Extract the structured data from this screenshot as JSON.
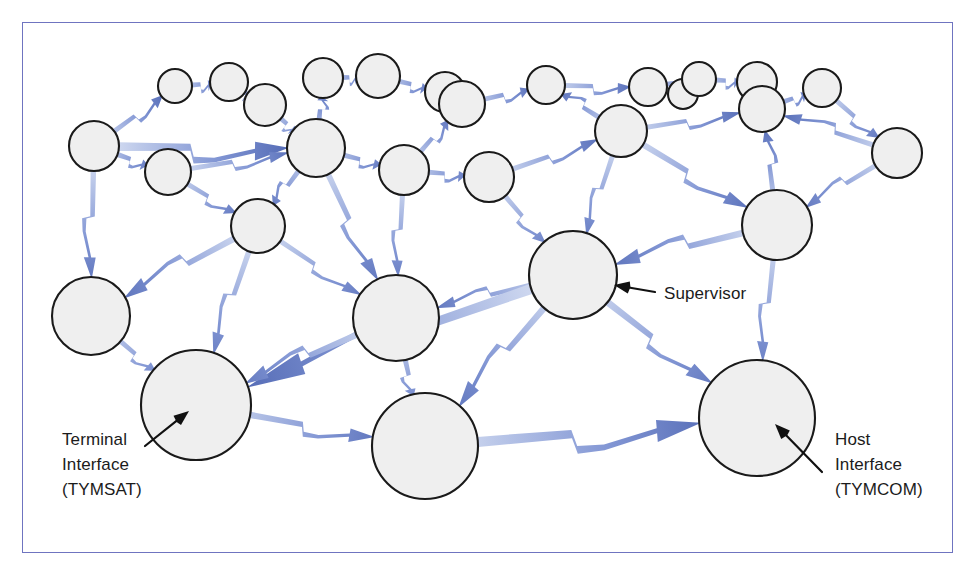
{
  "figure": {
    "kind": "network-topology-diagram",
    "border_color": "#6f74c0",
    "background_color": "#ffffff"
  },
  "style": {
    "node_fill": "#efefef",
    "node_stroke": "#1a1a1a",
    "link_blue_dark": "#4a62b0",
    "link_blue_mid": "#7e93d2",
    "link_blue_light": "#cfd8ef",
    "label_color": "#1b1b1b"
  },
  "labels": [
    {
      "id": "supervisor",
      "lines": [
        "Supervisor"
      ],
      "text_x": 664,
      "text_y": 299,
      "anchor": "start",
      "arrow_tail": [
        655,
        292
      ],
      "arrow_tip": [
        614,
        285
      ]
    },
    {
      "id": "terminal-interface",
      "lines": [
        "Terminal",
        "Interface",
        "(TYMSAT)"
      ],
      "text_x": 62,
      "text_y": 445,
      "anchor": "start",
      "arrow_tail": [
        145,
        446
      ],
      "arrow_tip": [
        189,
        411
      ]
    },
    {
      "id": "host-interface",
      "lines": [
        "Host",
        "Interface",
        "(TYMCOM)"
      ],
      "text_x": 835,
      "text_y": 445,
      "anchor": "start",
      "arrow_tail": [
        822,
        472
      ],
      "arrow_tip": [
        775,
        424
      ]
    }
  ],
  "chart_data": {
    "type": "diagram",
    "title": "",
    "node_count": 30,
    "link_count": 50,
    "nodes": [
      {
        "id": "n01",
        "x": 175,
        "y": 86,
        "r": 17
      },
      {
        "id": "n02",
        "x": 229,
        "y": 82,
        "r": 19
      },
      {
        "id": "n03",
        "x": 265,
        "y": 105,
        "r": 21
      },
      {
        "id": "n04",
        "x": 323,
        "y": 78,
        "r": 20
      },
      {
        "id": "n05",
        "x": 378,
        "y": 76,
        "r": 22
      },
      {
        "id": "n06",
        "x": 445,
        "y": 92,
        "r": 20
      },
      {
        "id": "n07",
        "x": 462,
        "y": 104,
        "r": 23
      },
      {
        "id": "n08",
        "x": 546,
        "y": 85,
        "r": 19
      },
      {
        "id": "n09",
        "x": 648,
        "y": 87,
        "r": 19
      },
      {
        "id": "n10",
        "x": 683,
        "y": 94,
        "r": 15
      },
      {
        "id": "n11",
        "x": 699,
        "y": 79,
        "r": 17
      },
      {
        "id": "n12",
        "x": 757,
        "y": 82,
        "r": 20
      },
      {
        "id": "n13",
        "x": 762,
        "y": 109,
        "r": 23
      },
      {
        "id": "n14",
        "x": 822,
        "y": 88,
        "r": 19
      },
      {
        "id": "n15",
        "x": 94,
        "y": 146,
        "r": 25
      },
      {
        "id": "n16",
        "x": 168,
        "y": 172,
        "r": 23
      },
      {
        "id": "n17",
        "x": 316,
        "y": 148,
        "r": 29
      },
      {
        "id": "n18",
        "x": 404,
        "y": 170,
        "r": 25
      },
      {
        "id": "n19",
        "x": 489,
        "y": 177,
        "r": 25
      },
      {
        "id": "n20",
        "x": 621,
        "y": 131,
        "r": 26
      },
      {
        "id": "n21",
        "x": 897,
        "y": 153,
        "r": 25
      },
      {
        "id": "n22",
        "x": 258,
        "y": 226,
        "r": 27
      },
      {
        "id": "n23",
        "x": 777,
        "y": 225,
        "r": 35
      },
      {
        "id": "n24",
        "x": 573,
        "y": 275,
        "r": 44
      },
      {
        "id": "n25",
        "x": 91,
        "y": 316,
        "r": 39
      },
      {
        "id": "n26",
        "x": 396,
        "y": 318,
        "r": 43
      },
      {
        "id": "n27",
        "x": 196,
        "y": 405,
        "r": 55
      },
      {
        "id": "n28",
        "x": 425,
        "y": 446,
        "r": 53
      },
      {
        "id": "n29",
        "x": 757,
        "y": 418,
        "r": 58
      }
    ],
    "links": [
      [
        "n15",
        "n01"
      ],
      [
        "n01",
        "n02"
      ],
      [
        "n02",
        "n03"
      ],
      [
        "n03",
        "n17"
      ],
      [
        "n04",
        "n05"
      ],
      [
        "n05",
        "n06"
      ],
      [
        "n06",
        "n07"
      ],
      [
        "n07",
        "n08"
      ],
      [
        "n08",
        "n09"
      ],
      [
        "n09",
        "n11"
      ],
      [
        "n10",
        "n11"
      ],
      [
        "n11",
        "n12"
      ],
      [
        "n12",
        "n13"
      ],
      [
        "n13",
        "n14"
      ],
      [
        "n14",
        "n21"
      ],
      [
        "n15",
        "n16"
      ],
      [
        "n15",
        "n17"
      ],
      [
        "n15",
        "n25"
      ],
      [
        "n16",
        "n17"
      ],
      [
        "n16",
        "n22"
      ],
      [
        "n17",
        "n04"
      ],
      [
        "n17",
        "n18"
      ],
      [
        "n17",
        "n22"
      ],
      [
        "n17",
        "n26"
      ],
      [
        "n18",
        "n07"
      ],
      [
        "n18",
        "n19"
      ],
      [
        "n18",
        "n26"
      ],
      [
        "n19",
        "n20"
      ],
      [
        "n19",
        "n24"
      ],
      [
        "n20",
        "n08"
      ],
      [
        "n20",
        "n13"
      ],
      [
        "n20",
        "n24"
      ],
      [
        "n20",
        "n23"
      ],
      [
        "n21",
        "n23"
      ],
      [
        "n21",
        "n13"
      ],
      [
        "n22",
        "n25"
      ],
      [
        "n22",
        "n26"
      ],
      [
        "n22",
        "n27"
      ],
      [
        "n23",
        "n24"
      ],
      [
        "n23",
        "n29"
      ],
      [
        "n23",
        "n13"
      ],
      [
        "n24",
        "n26"
      ],
      [
        "n24",
        "n27"
      ],
      [
        "n24",
        "n28"
      ],
      [
        "n24",
        "n29"
      ],
      [
        "n25",
        "n27"
      ],
      [
        "n26",
        "n28"
      ],
      [
        "n26",
        "n27"
      ],
      [
        "n27",
        "n28"
      ],
      [
        "n28",
        "n29"
      ]
    ]
  }
}
